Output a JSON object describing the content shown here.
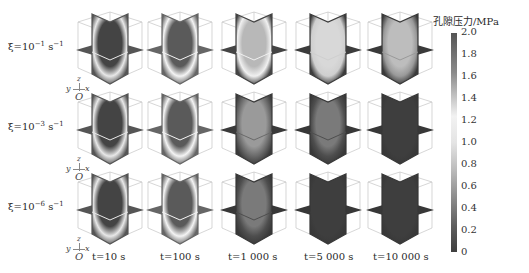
{
  "figure": {
    "rows": [
      {
        "label_prefix": "ξ=10",
        "exp": "−1",
        "unit": " s",
        "unit_exp": "−1"
      },
      {
        "label_prefix": "ξ=10",
        "exp": "−3",
        "unit": " s",
        "unit_exp": "−1"
      },
      {
        "label_prefix": "ξ=10",
        "exp": "−6",
        "unit": " s",
        "unit_exp": "−1"
      }
    ],
    "columns": [
      {
        "label": "t=10 s"
      },
      {
        "label": "t=100 s"
      },
      {
        "label": "t=1 000 s"
      },
      {
        "label": "t=5 000 s"
      },
      {
        "label": "t=10 000 s"
      }
    ],
    "axis_glyph": {
      "y": "y",
      "z": "z",
      "x": "x",
      "origin": "O"
    },
    "colorbar": {
      "title": "孔隙压力/MPa",
      "ticks": [
        "2.0",
        "1.8",
        "1.6",
        "1.4",
        "1.2",
        "1.0",
        "0.8",
        "0.6",
        "0.4",
        "0.2",
        "0"
      ]
    },
    "colors": {
      "dark": "#3a3a3a",
      "mid": "#7a7a7a",
      "light": "#e8e8e8",
      "frame": "#bdbdbd"
    }
  }
}
